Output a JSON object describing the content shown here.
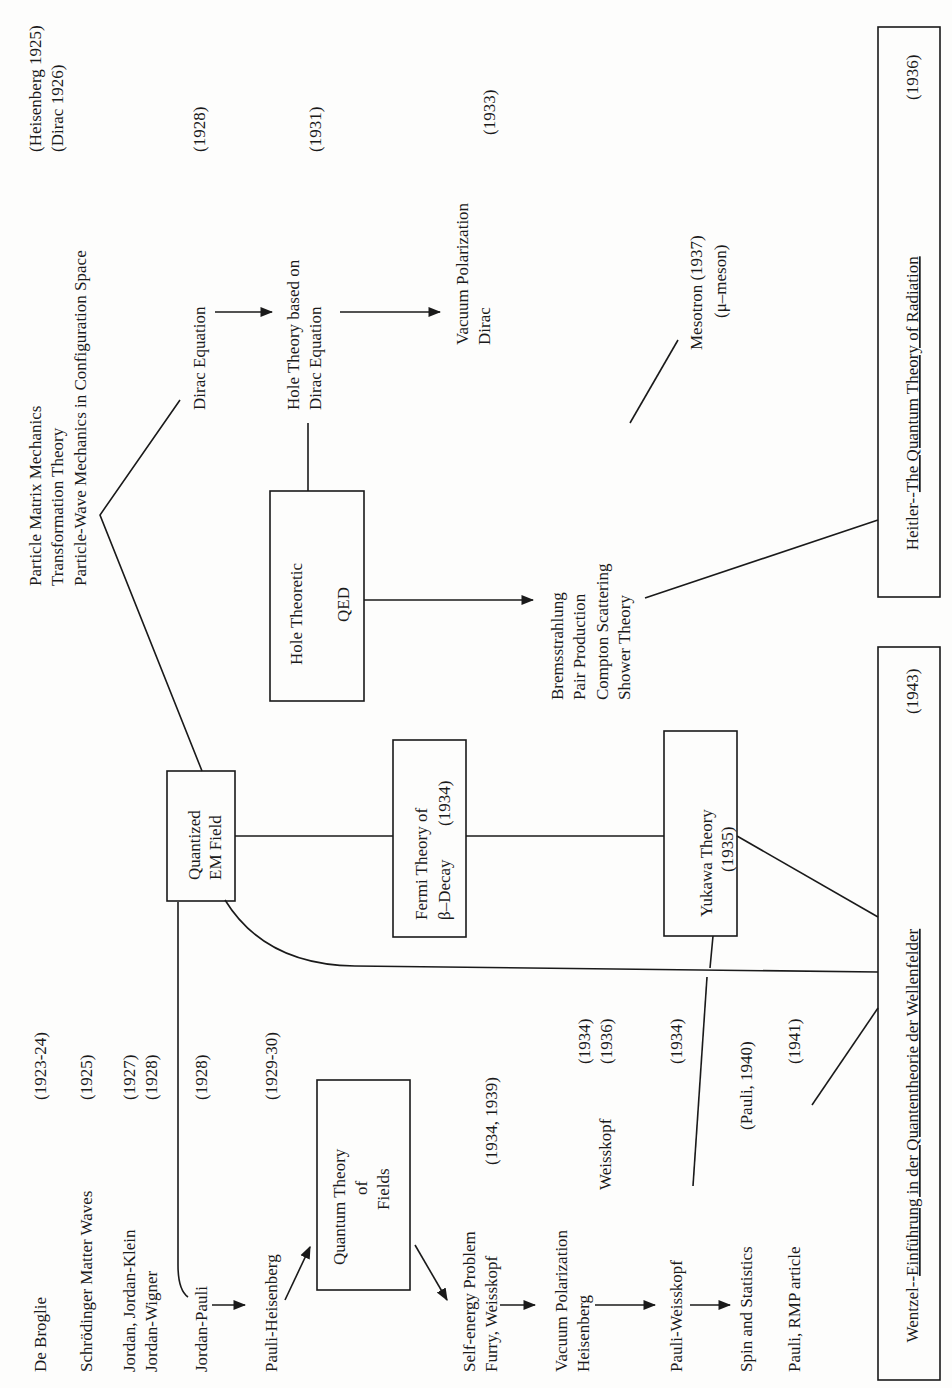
{
  "diagram": {
    "orientation": "rotated 90° counterclockwise",
    "left_column": [
      {
        "text": "De Broglie",
        "year": "(1923-24)"
      },
      {
        "text": "Schrödinger Matter Waves",
        "year": "(1925)"
      },
      {
        "text": "Jordan, Jordan-Klein",
        "year": "(1927)"
      },
      {
        "text": "Jordan-Wigner",
        "year": "(1928)"
      },
      {
        "text": "Jordan-Pauli",
        "year": "(1928)"
      },
      {
        "text": "Pauli-Heisenberg",
        "year": "(1929-30)"
      },
      {
        "text": "Self-energy Problem",
        "year": "(1934, 1939)"
      },
      {
        "text": "Furry, Weisskopf",
        "year": ""
      },
      {
        "text": "Vacuum Polarization",
        "year": "(1934)"
      },
      {
        "text": "Heisenberg",
        "year": ""
      },
      {
        "text": "Weisskopf",
        "year": "(1936)"
      },
      {
        "text": "Pauli-Weisskopf",
        "year": "(1934)"
      },
      {
        "text": "Spin and Statistics",
        "year": "(Pauli, 1940)"
      },
      {
        "text": "Pauli, RMP article",
        "year": "(1941)"
      }
    ],
    "boxes": {
      "qtf": {
        "line1": "Quantum Theory",
        "line2": "of",
        "line3": "Fields"
      },
      "qem": {
        "line1": "Quantized",
        "line2": "EM Field"
      },
      "fermi": {
        "line1": "Fermi Theory of",
        "line2": "β–Decay",
        "year": "(1934)"
      },
      "yukawa": {
        "line1": "Yukawa Theory",
        "line2": "(1935)"
      },
      "hole_qed": {
        "line1": "Hole Theoretic",
        "line2": "QED"
      },
      "wentzel": {
        "prefix": "Wentzel--",
        "title": "Einführung in der Quantentheorie der Wellenfelder",
        "year": "(1943)"
      },
      "heitler": {
        "prefix": "Heitler--",
        "title": "The Quantum Theory of Radiation",
        "year": "(1936)"
      }
    },
    "top_column": {
      "line1": {
        "text": "Particle Matrix Mechanics",
        "year": "(Heisenberg 1925)"
      },
      "line2": {
        "text": "Transformation Theory",
        "year": "(Dirac 1926)"
      },
      "line3": {
        "text": "Particle-Wave Mechanics in Configuration Space",
        "year": ""
      }
    },
    "dirac_equation": {
      "text": "Dirac Equation",
      "year": "(1928)"
    },
    "hole_theory": {
      "line1": "Hole Theory based on",
      "line2": "Dirac Equation",
      "year": "(1931)"
    },
    "vacuum_pol_dirac": {
      "line1": "Vacuum Polarization",
      "line2": "Dirac",
      "year": "(1933)"
    },
    "processes": {
      "line1": "Bremsstrahlung",
      "line2": "Pair Production",
      "line3": "Compton Scattering",
      "line4": "Shower Theory"
    },
    "mesotron": {
      "line1": "Mesotron (1937)",
      "line2": "(μ–meson)"
    }
  }
}
